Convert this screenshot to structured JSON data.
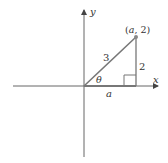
{
  "diagram": {
    "type": "right-triangle-on-coordinate-axes",
    "axes": {
      "x_label": "x",
      "y_label": "y"
    },
    "point_label": "(a, 2)",
    "point_label_parts": {
      "open": "(",
      "var": "a",
      "rest": ", 2)"
    },
    "hypotenuse_label": "3",
    "vertical_leg_label": "2",
    "horizontal_leg_label": "a",
    "angle_label": "θ",
    "colors": {
      "axis": "#555555",
      "triangle": "#666666",
      "point": "#777777",
      "text": "#333333"
    }
  }
}
